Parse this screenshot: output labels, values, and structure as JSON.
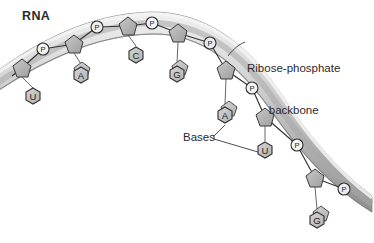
{
  "figure": {
    "title": "RNA",
    "type": "biology-diagram",
    "background_color": "#ffffff",
    "ink_color": "#2b2b2b"
  },
  "labels": {
    "rna": "RNA",
    "backbone_line1": "Ribose-phosphate",
    "backbone_line2": "backbone",
    "bases": "Bases"
  },
  "colors": {
    "ribbon_light": "#e2e2e2",
    "ribbon_mid": "#c4c4c4",
    "ribbon_dark": "#9a9a9a",
    "sugar_fill": "#b5b5b5",
    "base_fill": "#c9c9c9",
    "phosphate_fill": "#f2f2f2",
    "outline": "#3a3a3a"
  },
  "backbone": {
    "description": "Curved ribose-phosphate backbone ribbon arcing from upper-left, over a crest, and descending to lower-right",
    "sugars_count": 7,
    "phosphates_count": 6
  },
  "phosphates": [
    {
      "id": "p1",
      "symbol": "P",
      "x": 43,
      "y": 49
    },
    {
      "id": "p2",
      "symbol": "P",
      "x": 97,
      "y": 27
    },
    {
      "id": "p3",
      "symbol": "P",
      "x": 152,
      "y": 23
    },
    {
      "id": "p4",
      "symbol": "P",
      "x": 210,
      "y": 43
    },
    {
      "id": "p5",
      "symbol": "P",
      "x": 252,
      "y": 88
    },
    {
      "id": "p6",
      "symbol": "P",
      "x": 297,
      "y": 145
    },
    {
      "id": "p7",
      "symbol": "P",
      "x": 344,
      "y": 189
    }
  ],
  "sugars": [
    {
      "id": "s1",
      "x": 22,
      "y": 68
    },
    {
      "id": "s2",
      "x": 74,
      "y": 44
    },
    {
      "id": "s3",
      "x": 128,
      "y": 26
    },
    {
      "id": "s4",
      "x": 178,
      "y": 33
    },
    {
      "id": "s5",
      "x": 226,
      "y": 70
    },
    {
      "id": "s6",
      "x": 265,
      "y": 117
    },
    {
      "id": "s7",
      "x": 315,
      "y": 178
    }
  ],
  "bases": [
    {
      "id": "b1",
      "symbol": "U",
      "x": 33,
      "y": 96,
      "attached_to": "s1"
    },
    {
      "id": "b2",
      "symbol": "A",
      "x": 81,
      "y": 75,
      "attached_to": "s2"
    },
    {
      "id": "b3",
      "symbol": "C",
      "x": 136,
      "y": 55,
      "attached_to": "s3"
    },
    {
      "id": "b4",
      "symbol": "G",
      "x": 177,
      "y": 74,
      "attached_to": "s4"
    },
    {
      "id": "b5",
      "symbol": "A",
      "x": 225,
      "y": 115,
      "attached_to": "s5"
    },
    {
      "id": "b6",
      "symbol": "U",
      "x": 265,
      "y": 150,
      "attached_to": "s6"
    },
    {
      "id": "b7",
      "symbol": "G",
      "x": 317,
      "y": 220,
      "attached_to": "s7"
    }
  ],
  "leader_lines": {
    "backbone_pointer": "from 'Ribose-phosphate backbone' text left edge to the ribbon at approx (228,55)",
    "bases_pointer_a": "from 'Bases' text to base A at approx (225,125)",
    "bases_pointer_u": "from 'Bases' text to base U at approx (265,152)"
  }
}
